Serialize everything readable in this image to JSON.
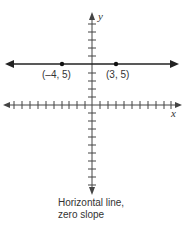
{
  "diagram": {
    "type": "coordinate-plane",
    "x_axis_label": "x",
    "y_axis_label": "y",
    "line": {
      "kind": "horizontal",
      "equation": "y = 5",
      "slope": 0
    },
    "points": [
      {
        "label": "(–4, 5)",
        "x": -4,
        "y": 5
      },
      {
        "label": "(3, 5)",
        "x": 3,
        "y": 5
      }
    ],
    "caption_line1": "Horizontal line,",
    "caption_line2": "zero slope"
  }
}
